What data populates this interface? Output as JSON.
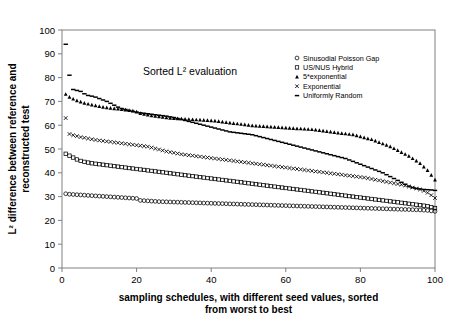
{
  "chart_data": {
    "type": "line",
    "title": "Sorted L² evaluation",
    "xlabel_line1": "sampling schedules, with different seed values, sorted",
    "xlabel_line2": "from worst to best",
    "ylabel_line1": "L² difference between reference and",
    "ylabel_line2": "reconstructed test",
    "xlim": [
      0,
      100
    ],
    "ylim": [
      0,
      100
    ],
    "xticks": [
      0,
      20,
      40,
      60,
      80,
      100
    ],
    "yticks": [
      0,
      10,
      20,
      30,
      40,
      50,
      60,
      70,
      80,
      90,
      100
    ],
    "grid": false,
    "legend_position": "top-right",
    "legend": [
      {
        "label": "Sinusodial Poisson Gap",
        "marker": "circle"
      },
      {
        "label": "US/NUS Hybrid",
        "marker": "square"
      },
      {
        "label": "5*exponential",
        "marker": "triangle"
      },
      {
        "label": "Exponential",
        "marker": "cross"
      },
      {
        "label": "Uniformly Random",
        "marker": "dash"
      }
    ],
    "x": [
      1,
      2,
      3,
      4,
      5,
      6,
      7,
      8,
      9,
      10,
      11,
      12,
      13,
      14,
      15,
      16,
      17,
      18,
      19,
      20,
      21,
      22,
      23,
      24,
      25,
      26,
      27,
      28,
      29,
      30,
      31,
      32,
      33,
      34,
      35,
      36,
      37,
      38,
      39,
      40,
      41,
      42,
      43,
      44,
      45,
      46,
      47,
      48,
      49,
      50,
      51,
      52,
      53,
      54,
      55,
      56,
      57,
      58,
      59,
      60,
      61,
      62,
      63,
      64,
      65,
      66,
      67,
      68,
      69,
      70,
      71,
      72,
      73,
      74,
      75,
      76,
      77,
      78,
      79,
      80,
      81,
      82,
      83,
      84,
      85,
      86,
      87,
      88,
      89,
      90,
      91,
      92,
      93,
      94,
      95,
      96,
      97,
      98,
      99,
      100
    ],
    "series": [
      {
        "name": "Uniformly Random",
        "marker": "dash",
        "values": [
          94.0,
          81.0,
          75.0,
          74.6,
          74.2,
          73.2,
          72.5,
          72.2,
          71.8,
          71.2,
          70.6,
          70.0,
          69.2,
          68.4,
          67.6,
          67.0,
          66.6,
          66.2,
          65.8,
          65.5,
          65.2,
          65.0,
          64.8,
          64.6,
          64.4,
          64.2,
          64.0,
          63.8,
          63.5,
          63.2,
          62.8,
          62.4,
          62.0,
          61.6,
          61.2,
          60.8,
          60.4,
          60.0,
          59.6,
          59.2,
          58.8,
          58.4,
          58.0,
          57.6,
          57.2,
          57.0,
          56.8,
          56.6,
          56.4,
          56.2,
          56.0,
          55.6,
          55.2,
          54.8,
          54.4,
          54.0,
          53.6,
          53.2,
          52.8,
          52.4,
          52.0,
          51.6,
          51.2,
          50.8,
          50.4,
          50.0,
          49.6,
          49.2,
          48.8,
          48.4,
          48.0,
          47.6,
          47.2,
          46.8,
          46.4,
          46.0,
          45.4,
          44.8,
          44.2,
          43.6,
          43.0,
          42.4,
          41.8,
          41.2,
          40.6,
          40.0,
          39.2,
          38.4,
          37.6,
          36.8,
          36.0,
          35.2,
          34.4,
          33.8,
          33.4,
          33.2,
          33.0,
          32.9,
          32.8,
          32.6
        ]
      },
      {
        "name": "5*exponential",
        "marker": "triangle",
        "values": [
          73.0,
          71.8,
          71.0,
          70.3,
          69.8,
          69.3,
          68.9,
          68.5,
          68.2,
          67.9,
          67.6,
          67.4,
          67.2,
          67.0,
          66.8,
          66.6,
          66.4,
          66.2,
          66.0,
          65.6,
          65.0,
          64.6,
          64.3,
          64.0,
          63.8,
          63.6,
          63.4,
          63.2,
          63.0,
          62.9,
          62.8,
          62.7,
          62.6,
          62.5,
          62.4,
          62.3,
          62.2,
          62.1,
          62.0,
          61.9,
          61.8,
          61.6,
          61.4,
          61.2,
          61.0,
          60.8,
          60.6,
          60.4,
          60.2,
          60.0,
          59.8,
          59.7,
          59.6,
          59.5,
          59.4,
          59.3,
          59.2,
          59.1,
          59.0,
          58.9,
          58.8,
          58.7,
          58.6,
          58.5,
          58.4,
          58.3,
          58.2,
          58.0,
          57.8,
          57.6,
          57.4,
          57.2,
          57.0,
          56.8,
          56.6,
          56.4,
          56.2,
          56.0,
          55.6,
          55.2,
          54.8,
          54.4,
          54.0,
          53.4,
          52.8,
          52.2,
          51.6,
          51.0,
          50.2,
          49.4,
          48.6,
          47.8,
          47.0,
          46.0,
          45.0,
          44.0,
          42.5,
          41.0,
          39.0,
          37.0
        ]
      },
      {
        "name": "Exponential",
        "marker": "cross",
        "values": [
          63.0,
          56.3,
          55.8,
          55.4,
          55.0,
          54.7,
          54.4,
          54.1,
          53.8,
          53.6,
          53.4,
          53.2,
          53.0,
          52.8,
          52.6,
          52.4,
          52.2,
          52.0,
          51.8,
          51.6,
          51.4,
          51.2,
          51.0,
          50.6,
          50.2,
          49.8,
          49.4,
          49.0,
          48.7,
          48.4,
          48.1,
          47.8,
          47.6,
          47.4,
          47.2,
          47.0,
          46.8,
          46.6,
          46.4,
          46.2,
          46.0,
          45.8,
          45.6,
          45.4,
          45.2,
          45.0,
          44.8,
          44.6,
          44.4,
          44.2,
          44.0,
          43.8,
          43.6,
          43.4,
          43.2,
          43.0,
          42.8,
          42.6,
          42.4,
          42.2,
          42.0,
          41.8,
          41.6,
          41.4,
          41.2,
          41.0,
          40.8,
          40.6,
          40.4,
          40.2,
          40.0,
          39.8,
          39.6,
          39.4,
          39.2,
          39.0,
          38.8,
          38.6,
          38.4,
          38.2,
          38.0,
          37.7,
          37.4,
          37.1,
          36.8,
          36.5,
          36.2,
          35.9,
          35.6,
          35.3,
          35.0,
          34.6,
          34.2,
          33.8,
          33.4,
          33.0,
          32.4,
          31.6,
          30.6,
          29.4
        ]
      },
      {
        "name": "US/NUS Hybrid",
        "marker": "square",
        "values": [
          48.0,
          47.2,
          46.4,
          45.6,
          45.0,
          44.6,
          44.3,
          44.0,
          43.8,
          43.6,
          43.4,
          43.2,
          43.0,
          42.8,
          42.6,
          42.4,
          42.2,
          42.0,
          41.8,
          41.6,
          41.4,
          41.2,
          41.0,
          40.8,
          40.6,
          40.4,
          40.2,
          40.0,
          39.8,
          39.6,
          39.4,
          39.2,
          39.0,
          38.8,
          38.6,
          38.4,
          38.2,
          38.0,
          37.8,
          37.6,
          37.4,
          37.2,
          37.0,
          36.8,
          36.6,
          36.4,
          36.2,
          36.0,
          35.8,
          35.6,
          35.4,
          35.2,
          35.0,
          34.8,
          34.6,
          34.4,
          34.2,
          34.0,
          33.8,
          33.6,
          33.4,
          33.2,
          33.0,
          32.8,
          32.6,
          32.4,
          32.2,
          32.0,
          31.8,
          31.6,
          31.4,
          31.2,
          31.0,
          30.8,
          30.6,
          30.4,
          30.2,
          30.0,
          29.8,
          29.6,
          29.4,
          29.2,
          29.0,
          28.8,
          28.6,
          28.4,
          28.2,
          28.0,
          27.8,
          27.6,
          27.4,
          27.2,
          27.0,
          26.8,
          26.6,
          26.4,
          26.2,
          26.0,
          25.6,
          25.2
        ]
      },
      {
        "name": "Sinusodial Poisson Gap",
        "marker": "circle",
        "values": [
          31.2,
          31.0,
          30.9,
          30.8,
          30.7,
          30.6,
          30.5,
          30.4,
          30.3,
          30.2,
          30.1,
          30.0,
          29.9,
          29.8,
          29.7,
          29.6,
          29.5,
          29.4,
          29.3,
          29.2,
          28.4,
          28.3,
          28.2,
          28.1,
          28.0,
          27.9,
          27.85,
          27.8,
          27.75,
          27.7,
          27.65,
          27.6,
          27.55,
          27.5,
          27.45,
          27.4,
          27.35,
          27.3,
          27.25,
          27.2,
          27.15,
          27.1,
          27.05,
          27.0,
          26.95,
          26.9,
          26.85,
          26.8,
          26.75,
          26.7,
          26.65,
          26.6,
          26.55,
          26.5,
          26.45,
          26.4,
          26.35,
          26.3,
          26.25,
          26.2,
          26.15,
          26.1,
          26.05,
          26.0,
          25.95,
          25.9,
          25.85,
          25.8,
          25.75,
          25.7,
          25.65,
          25.6,
          25.55,
          25.5,
          25.45,
          25.4,
          25.35,
          25.3,
          25.25,
          25.2,
          25.15,
          25.1,
          25.05,
          25.0,
          24.95,
          24.9,
          24.85,
          24.8,
          24.75,
          24.7,
          24.65,
          24.6,
          24.55,
          24.5,
          24.45,
          24.4,
          24.3,
          24.2,
          24.0,
          23.8
        ]
      }
    ]
  }
}
